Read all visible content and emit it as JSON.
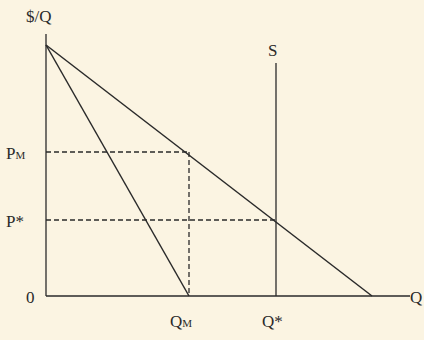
{
  "diagram": {
    "y_axis_label": "$/Q",
    "x_axis_label": "Q",
    "origin_label": "0",
    "supply_label": "S",
    "price_labels": {
      "monopoly": {
        "main": "P",
        "sub": "M"
      },
      "competitive": "P*"
    },
    "quantity_labels": {
      "monopoly": {
        "main": "Q",
        "sub": "M"
      },
      "competitive": "Q*"
    },
    "curves": [
      {
        "name": "Demand",
        "from": [
          0,
          1.0
        ],
        "to": [
          1.0,
          0
        ]
      },
      {
        "name": "Marginal Revenue",
        "from": [
          0,
          1.0
        ],
        "to": [
          0.5,
          0
        ]
      },
      {
        "name": "Supply",
        "type": "vertical",
        "at_q": "Q*"
      }
    ],
    "colors": {
      "background": "#fbf4e2",
      "line": "#2a2a2a"
    }
  }
}
